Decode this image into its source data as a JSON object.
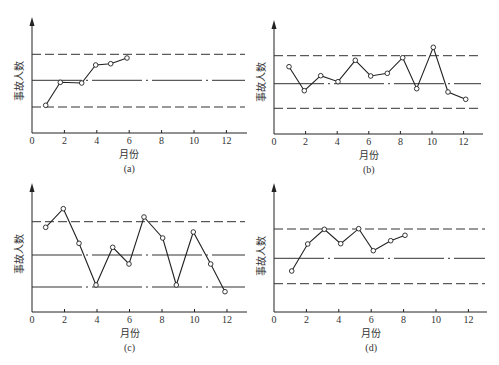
{
  "chart_data": [
    {
      "type": "line",
      "panel": "(a)",
      "title": "",
      "xlabel": "月份",
      "ylabel": "事故人数",
      "xlim": [
        0,
        13
      ],
      "xticks": [
        0,
        2,
        4,
        6,
        8,
        10,
        12
      ],
      "control_lines": {
        "upper": "dashed",
        "center": "dash-dot",
        "lower": "dashed"
      },
      "grid": false,
      "x": [
        1,
        2,
        3,
        4,
        5,
        6
      ],
      "values_relative": [
        -0.93,
        -0.07,
        -0.1,
        0.57,
        0.62,
        0.83
      ],
      "note": "values relative to center line (0); upper control limit = +1, lower control limit = -1"
    },
    {
      "type": "line",
      "panel": "(b)",
      "title": "",
      "xlabel": "月份",
      "ylabel": "事故人数",
      "xlim": [
        0,
        13
      ],
      "xticks": [
        0,
        2,
        4,
        6,
        8,
        10,
        12
      ],
      "control_lines": {
        "upper": "dashed",
        "center": "dash-dot",
        "lower": "dashed"
      },
      "grid": false,
      "x": [
        1,
        2,
        3,
        4,
        5,
        6,
        7,
        8,
        9,
        10,
        11,
        12
      ],
      "values_relative": [
        0.6,
        -0.25,
        0.29,
        0.07,
        0.84,
        0.27,
        0.37,
        0.93,
        -0.18,
        1.3,
        -0.3,
        -0.63
      ],
      "note": "values relative to center line (0); upper control limit = +1, lower control limit = -1"
    },
    {
      "type": "line",
      "panel": "(c)",
      "title": "",
      "xlabel": "月份",
      "ylabel": "事故人数",
      "xlim": [
        0,
        13
      ],
      "xticks": [
        0,
        2,
        4,
        6,
        8,
        10,
        12
      ],
      "control_lines": {
        "upper": "dashed",
        "center": "dash-dot",
        "lower": "dash-dot"
      },
      "grid": false,
      "x": [
        1,
        2,
        3,
        4,
        5,
        6,
        7,
        8,
        9,
        10,
        11,
        12
      ],
      "values_relative": [
        0.83,
        1.39,
        0.35,
        -0.94,
        0.23,
        -0.28,
        1.14,
        0.51,
        -0.94,
        0.69,
        -0.28,
        -1.12
      ],
      "note": "values relative to center line (0); upper control limit = +1, lower control limit = -1"
    },
    {
      "type": "line",
      "panel": "(d)",
      "title": "",
      "xlabel": "月份",
      "ylabel": "事故人数",
      "xlim": [
        0,
        13
      ],
      "xticks": [
        0,
        2,
        4,
        6,
        8,
        10,
        12
      ],
      "control_lines": {
        "upper": "dashed",
        "center": "dash-dot",
        "lower": "dashed"
      },
      "grid": false,
      "x": [
        1,
        2,
        3,
        4,
        5,
        6,
        7,
        8
      ],
      "values_relative": [
        -0.43,
        0.5,
        1.0,
        0.5,
        1.02,
        0.26,
        0.6,
        0.79
      ],
      "note": "values relative to center line (0); upper control limit = +1, lower control limit = -1"
    }
  ],
  "panels": [
    {
      "label": "(a)",
      "xlabel": "月份",
      "ylabel": "事故人数",
      "tick_labels": [
        "0",
        "2",
        "4",
        "6",
        "8",
        "10",
        "12"
      ],
      "geom": {
        "x0": 32,
        "y0": 133,
        "yTop": 17,
        "xEnd": 247,
        "pxPerMonth": 16.2,
        "upper": 54.3,
        "center": 80.3,
        "lower": 107
      },
      "center_style": "dashdot",
      "lower_style": "dashed",
      "points": [
        [
          45.7,
          105.3
        ],
        [
          60.3,
          82.3
        ],
        [
          81.7,
          83
        ],
        [
          95.7,
          65
        ],
        [
          110.7,
          63.7
        ],
        [
          127,
          58
        ]
      ]
    },
    {
      "label": "(b)",
      "xlabel": "月份",
      "ylabel": "事故人数",
      "tick_labels": [
        "0",
        "2",
        "4",
        "6",
        "8",
        "10",
        "12"
      ],
      "geom": {
        "x0": 274,
        "y0": 134,
        "yTop": 20,
        "xEnd": 483,
        "pxPerMonth": 15.8,
        "upper": 55.7,
        "center": 83.7,
        "lower": 108.3
      },
      "center_style": "dashdot",
      "lower_style": "dashed",
      "points": [
        [
          289,
          66.7
        ],
        [
          304.3,
          90.7
        ],
        [
          320.7,
          75.7
        ],
        [
          338,
          81.7
        ],
        [
          355.3,
          60.3
        ],
        [
          370.7,
          76
        ],
        [
          387.3,
          73.3
        ],
        [
          402.7,
          57.7
        ],
        [
          416.7,
          88.7
        ],
        [
          433.3,
          47.3
        ],
        [
          448,
          92
        ],
        [
          465.7,
          99.3
        ]
      ]
    },
    {
      "label": "(c)",
      "xlabel": "月份",
      "ylabel": "事故人数",
      "tick_labels": [
        "0",
        "2",
        "4",
        "6",
        "8",
        "10",
        "12"
      ],
      "geom": {
        "x0": 32,
        "y0": 312,
        "yTop": 183,
        "xEnd": 247,
        "pxPerMonth": 16.25,
        "upper": 221.7,
        "center": 255,
        "lower": 287
      },
      "center_style": "dashdot",
      "lower_style": "dashdot",
      "points": [
        [
          45.7,
          227.3
        ],
        [
          63.3,
          208.7
        ],
        [
          79,
          243.3
        ],
        [
          96,
          285
        ],
        [
          112.7,
          247.3
        ],
        [
          129,
          264
        ],
        [
          144,
          217
        ],
        [
          162.7,
          238
        ],
        [
          176.3,
          285
        ],
        [
          193.3,
          232
        ],
        [
          210.7,
          264
        ],
        [
          225,
          291.7
        ]
      ]
    },
    {
      "label": "(d)",
      "xlabel": "月份",
      "ylabel": "事故人数",
      "tick_labels": [
        "0",
        "2",
        "4",
        "6",
        "8",
        "10",
        "12"
      ],
      "geom": {
        "x0": 274,
        "y0": 312,
        "yTop": 183,
        "xEnd": 487,
        "pxPerMonth": 16.2,
        "upper": 229,
        "center": 258.3,
        "lower": 283.7
      },
      "center_style": "dashdot",
      "lower_style": "dashed",
      "points": [
        [
          291.7,
          271
        ],
        [
          307.7,
          244
        ],
        [
          324.3,
          229.3
        ],
        [
          340.7,
          243.7
        ],
        [
          358.7,
          228.7
        ],
        [
          373.3,
          250.7
        ],
        [
          390.7,
          240.7
        ],
        [
          405,
          235.3
        ]
      ]
    }
  ],
  "colors": {
    "line": "#222222",
    "control": "#333333",
    "text": "#333333",
    "marker_fill": "#ffffff"
  }
}
